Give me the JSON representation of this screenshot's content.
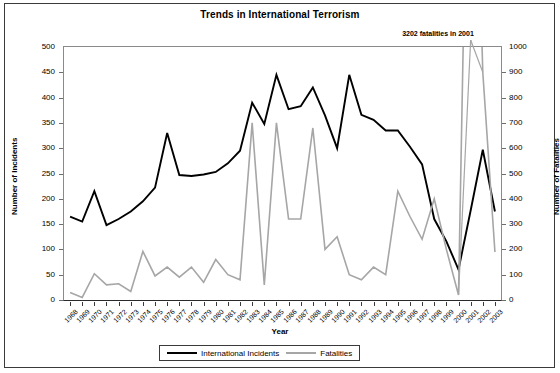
{
  "chart_data": {
    "type": "line",
    "title": "Trends in International Terrorism",
    "xlabel": "Year",
    "ylabel": "Number of Incidents",
    "ylabel_secondary": "Number of Fatalities",
    "grid": false,
    "legend_position": "bottom",
    "ylim": [
      0,
      500
    ],
    "ylim_secondary": [
      0,
      1000
    ],
    "ytick_values": [
      0,
      50,
      100,
      150,
      200,
      250,
      300,
      350,
      400,
      450,
      500
    ],
    "ytick_values_secondary": [
      0,
      100,
      200,
      300,
      400,
      500,
      600,
      700,
      800,
      900,
      1000
    ],
    "annotation": "3202 fatalities in 2001",
    "annotation_year": 2001,
    "categories": [
      "1968",
      "1969",
      "1970",
      "1971",
      "1972",
      "1973",
      "1974",
      "1975",
      "1976",
      "1977",
      "1978",
      "1979",
      "1980",
      "1981",
      "1982",
      "1983",
      "1984",
      "1985",
      "1986",
      "1987",
      "1988",
      "1989",
      "1990",
      "1991",
      "1992",
      "1993",
      "1994",
      "1995",
      "1996",
      "1997",
      "1998",
      "1999",
      "2000",
      "2001",
      "2002",
      "2003"
    ],
    "series": [
      {
        "name": "International Incidents",
        "axis": "left",
        "color": "#000000",
        "values": [
          165,
          155,
          215,
          148,
          160,
          175,
          195,
          222,
          330,
          247,
          245,
          248,
          253,
          270,
          295,
          390,
          348,
          445,
          377,
          383,
          420,
          365,
          300,
          445,
          366,
          356,
          335,
          335,
          303,
          268,
          160,
          116,
          60,
          177,
          297,
          175
        ]
      },
      {
        "name": "Fatalities",
        "axis": "right",
        "color": "#a6a6a6",
        "values": [
          30,
          10,
          104,
          60,
          64,
          34,
          192,
          95,
          130,
          90,
          130,
          70,
          160,
          100,
          80,
          700,
          60,
          700,
          320,
          320,
          680,
          200,
          250,
          100,
          80,
          130,
          100,
          430,
          330,
          240,
          400,
          200,
          20,
          3202,
          900,
          190
        ],
        "clipped_above": 1000,
        "clipped_points": [
          {
            "year": "2001",
            "value": 3202
          }
        ]
      }
    ]
  },
  "legend": {
    "entries": [
      {
        "label": "International Incidents"
      },
      {
        "label": "Fatalities"
      }
    ]
  }
}
